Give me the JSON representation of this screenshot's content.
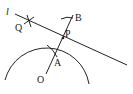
{
  "diagram": {
    "labels": {
      "line": "l",
      "Q": "Q",
      "B": "B",
      "P": "P",
      "A": "A",
      "O": "O"
    }
  }
}
